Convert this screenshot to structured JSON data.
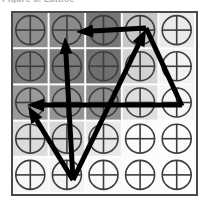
{
  "figure": {
    "caption_fragment": "Figure 3. Lattice",
    "frame": {
      "x": 11,
      "y": 11,
      "width": 187,
      "height": 185,
      "border_color": "#4a4a4a",
      "border_width": 2,
      "background": "#fcfcfc"
    },
    "grid": {
      "rows": 5,
      "cols": 5,
      "cell_width": 36.6,
      "cell_height": 36.2,
      "gap_color": "#ffffff",
      "gap_width": 2
    },
    "motif": {
      "name": "crosshair-circle",
      "stroke_color": "#3d3d3d",
      "stroke_width": 1.6,
      "radius_ratio": 0.4
    },
    "cell_shades": [
      [
        "#8f8f8f",
        "#8a8a8a",
        "#767676",
        "#c6c6c6",
        "#eaeaea"
      ],
      [
        "#808080",
        "#7a7a7a",
        "#6f6f6f",
        "#d3d3d3",
        "#f2f2f2"
      ],
      [
        "#9a9a9a",
        "#949494",
        "#8c8c8c",
        "#dedede",
        "#f6f6f6"
      ],
      [
        "#dcdcdc",
        "#d6d6d6",
        "#e8e8e8",
        "#fbfbfb",
        "#fdfdfd"
      ],
      [
        "#f7f7f7",
        "#f4f4f4",
        "#fafafa",
        "#fdfdfd",
        "#fefefe"
      ]
    ],
    "vectors": {
      "stroke_color": "#000000",
      "stroke_width": 5,
      "arrow_head_length": 17,
      "arrow_head_width": 13,
      "items": [
        {
          "name": "vector-up-left-diagonal",
          "from": [
            73,
            180
          ],
          "to": [
            65,
            37
          ],
          "arrow": "end",
          "label": "a1"
        },
        {
          "name": "vector-top-horizontal-left",
          "from": [
            146,
            28
          ],
          "to": [
            76,
            32
          ],
          "arrow": "end",
          "label": "a2"
        },
        {
          "name": "vector-up-right-diagonal",
          "from": [
            73,
            180
          ],
          "to": [
            146,
            29
          ],
          "arrow": "end",
          "label": "a3"
        },
        {
          "name": "vector-mid-horizontal-left",
          "from": [
            182,
            105
          ],
          "to": [
            27,
            105
          ],
          "arrow": "end",
          "label": "a4"
        },
        {
          "name": "vector-lower-left-diagonal",
          "from": [
            73,
            180
          ],
          "to": [
            28,
            106
          ],
          "arrow": "end",
          "label": "a5"
        },
        {
          "name": "edge-right-descending",
          "from": [
            146,
            28
          ],
          "to": [
            182,
            106
          ],
          "arrow": "none",
          "label": "edge"
        }
      ]
    }
  }
}
